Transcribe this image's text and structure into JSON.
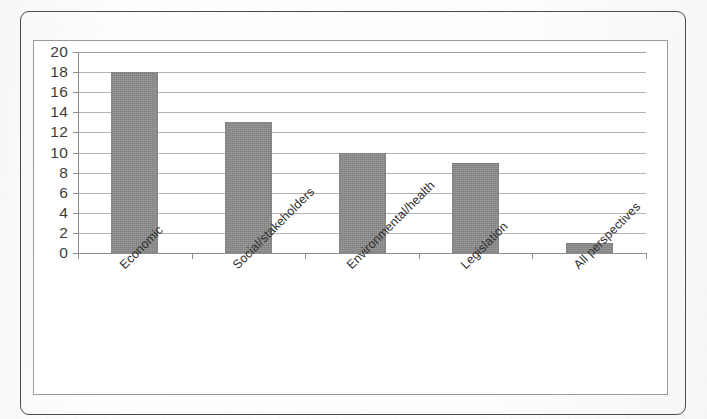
{
  "chart_data": {
    "type": "bar",
    "title": "",
    "subtitle": "",
    "xlabel": "",
    "ylabel": "",
    "categories": [
      "Economic",
      "Social/stakeholders",
      "Environmental/health",
      "Legislation",
      "All perspectives"
    ],
    "values": [
      18,
      13,
      10,
      9,
      1
    ],
    "ylim": [
      0,
      20
    ],
    "ytick_step": 2,
    "ytick_labels": [
      "20",
      "18",
      "16",
      "14",
      "12",
      "10",
      "8",
      "6",
      "4",
      "2",
      "0"
    ],
    "grid": "horizontal",
    "legend": "none",
    "bar_color": "#8c8c8c",
    "gridline_color": "#b4b4b4",
    "axis_color": "#8d8d8d",
    "label_rotation_degrees": -45
  },
  "frame": {
    "outer_border_color": "#4a4a4a",
    "plot_border_color": "#9a9a9a",
    "background_color": "#ffffff"
  }
}
